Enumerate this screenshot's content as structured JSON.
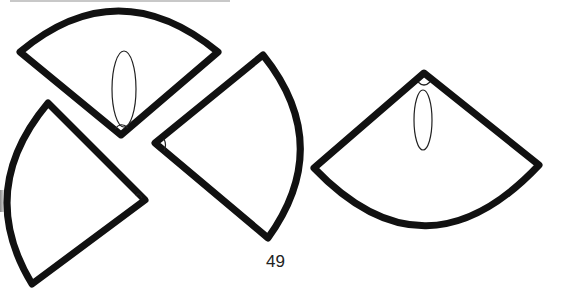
{
  "page": {
    "number": "49"
  },
  "figure": {
    "stroke_color": "#111111",
    "background": "#ffffff",
    "shapes": [
      {
        "name": "top-sector",
        "has_oval": true
      },
      {
        "name": "bottom-left-sector",
        "has_oval": false
      },
      {
        "name": "middle-sector",
        "has_oval": false
      },
      {
        "name": "right-sector",
        "has_oval": true
      }
    ]
  }
}
